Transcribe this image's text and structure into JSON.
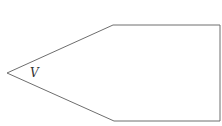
{
  "diagram": {
    "shape": "pentagon",
    "vertex_label": "V",
    "stroke_color": "#6e6e6e",
    "fill_color": "#ffffff"
  }
}
